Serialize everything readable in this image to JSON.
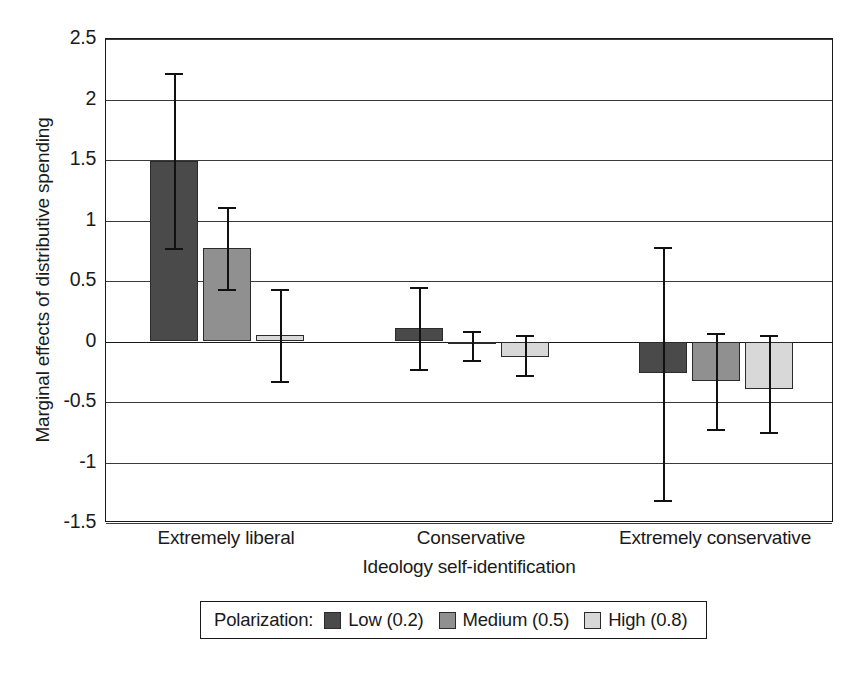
{
  "chart_data": {
    "type": "bar",
    "title": "",
    "subtitle": "",
    "xlabel": "Ideology self-identification",
    "ylabel": "Marginal effects of distributive spending",
    "categories": [
      "Extremely liberal",
      "Conservative",
      "Extremely conservative"
    ],
    "ylim": [
      -1.5,
      2.5
    ],
    "y_ticks": [
      2.5,
      2,
      1.5,
      1,
      0.5,
      0,
      -0.5,
      -1,
      -1.5
    ],
    "y_tick_labels": [
      "2.5",
      "2",
      "1.5",
      "1",
      "0.5",
      "0",
      "-0.5",
      "-1",
      "-1.5"
    ],
    "grid": true,
    "grid_axis": "y",
    "legend_position": "below",
    "legend_title": "Polarization:",
    "error_bars": true,
    "series": [
      {
        "name": "Low (0.2)",
        "color": "#4a4a4a",
        "values": [
          1.49,
          0.11,
          -0.26
        ],
        "err_low": [
          0.77,
          -0.23,
          -1.31
        ],
        "err_high": [
          2.22,
          0.45,
          0.78
        ]
      },
      {
        "name": "Medium (0.5)",
        "color": "#909090",
        "values": [
          0.77,
          -0.02,
          -0.33
        ],
        "err_low": [
          0.43,
          -0.15,
          -0.72
        ],
        "err_high": [
          1.11,
          0.09,
          0.07
        ]
      },
      {
        "name": "High (0.8)",
        "color": "#d8d8d8",
        "values": [
          0.05,
          -0.13,
          -0.39
        ],
        "err_low": [
          -0.33,
          -0.28,
          -0.75
        ],
        "err_high": [
          0.43,
          0.05,
          0.05
        ]
      }
    ]
  },
  "axes": {
    "y_title": "Marginal effects of distributive spending",
    "x_title": "Ideology self-identification",
    "y_tick_labels": [
      "2.5",
      "2",
      "1.5",
      "1",
      "0.5",
      "0",
      "-0.5",
      "-1",
      "-1.5"
    ],
    "x_tick_labels": [
      "Extremely liberal",
      "Conservative",
      "Extremely conservative"
    ]
  },
  "legend": {
    "title": "Polarization:",
    "entries": [
      {
        "label": "Low (0.2)",
        "color": "#4a4a4a"
      },
      {
        "label": "Medium (0.5)",
        "color": "#909090"
      },
      {
        "label": "High (0.8)",
        "color": "#d8d8d8"
      }
    ]
  }
}
